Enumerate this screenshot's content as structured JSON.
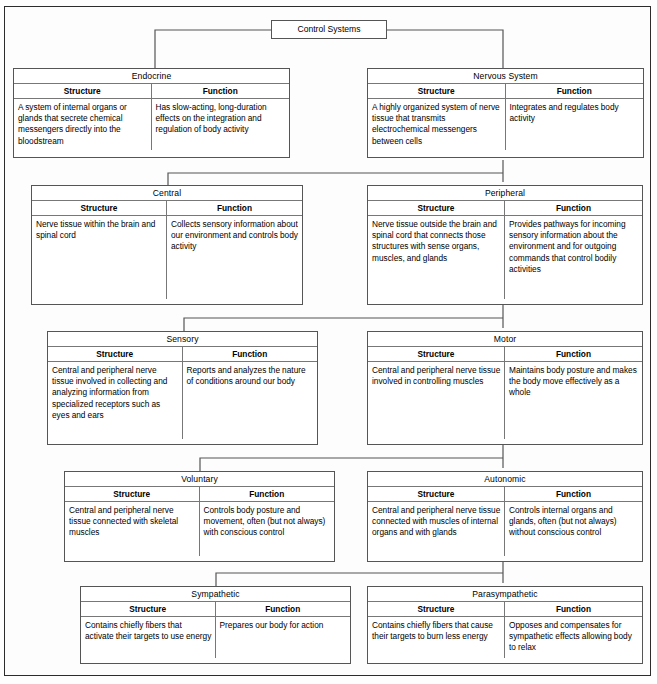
{
  "diagram": {
    "type": "hierarchy-chart",
    "title": "Control Systems",
    "column_headers": [
      "Structure",
      "Function"
    ],
    "root": {
      "label": "Control Systems"
    },
    "levels": [
      {
        "level": 1,
        "nodes": [
          {
            "id": "endocrine",
            "label": "Endocrine",
            "structure": "A system of internal organs or glands that secrete chemical messengers directly into the bloodstream",
            "function": "Has slow-acting, long-duration effects on the integration and regulation of body activity"
          },
          {
            "id": "nervous-system",
            "label": "Nervous System",
            "structure": "A highly organized system of nerve tissue that transmits electrochemical messengers between cells",
            "function": "Integrates and regulates body activity"
          }
        ]
      },
      {
        "level": 2,
        "nodes": [
          {
            "id": "central",
            "label": "Central",
            "structure": "Nerve tissue within the brain and spinal cord",
            "function": "Collects sensory information about our environment and controls body activity"
          },
          {
            "id": "peripheral",
            "label": "Peripheral",
            "structure": "Nerve tissue outside the brain and spinal cord that connects those structures with sense organs, muscles, and glands",
            "function": "Provides pathways for incoming sensory information about the environment and for outgoing commands that control bodily activities"
          }
        ]
      },
      {
        "level": 3,
        "nodes": [
          {
            "id": "sensory",
            "label": "Sensory",
            "structure": "Central and peripheral nerve tissue involved in collecting and analyzing information from specialized receptors such as eyes and ears",
            "function": "Reports and analyzes the nature of conditions around our body"
          },
          {
            "id": "motor",
            "label": "Motor",
            "structure": "Central and peripheral nerve tissue involved in controlling muscles",
            "function": "Maintains body posture and makes the body move effectively as a whole"
          }
        ]
      },
      {
        "level": 4,
        "nodes": [
          {
            "id": "voluntary",
            "label": "Voluntary",
            "structure": "Central and peripheral nerve tissue connected with skeletal muscles",
            "function": "Controls body posture and movement, often (but not always) with conscious control"
          },
          {
            "id": "autonomic",
            "label": "Autonomic",
            "structure": "Central and peripheral nerve tissue connected with muscles of internal organs and with glands",
            "function": "Controls internal organs and glands, often (but not always) without conscious control"
          }
        ]
      },
      {
        "level": 5,
        "nodes": [
          {
            "id": "sympathetic",
            "label": "Sympathetic",
            "structure": "Contains chiefly fibers that activate their targets to use energy",
            "function": "Prepares our body for action"
          },
          {
            "id": "parasympathetic",
            "label": "Parasympathetic",
            "structure": "Contains chiefly fibers that cause their targets to burn less energy",
            "function": "Opposes and compensates for sympathetic effects allowing body to relax"
          }
        ]
      }
    ],
    "colors": {
      "background": "#ffffff",
      "border": "#555555",
      "frame": "#2c2c2c",
      "text": "#000000",
      "connector": "#555555"
    }
  }
}
